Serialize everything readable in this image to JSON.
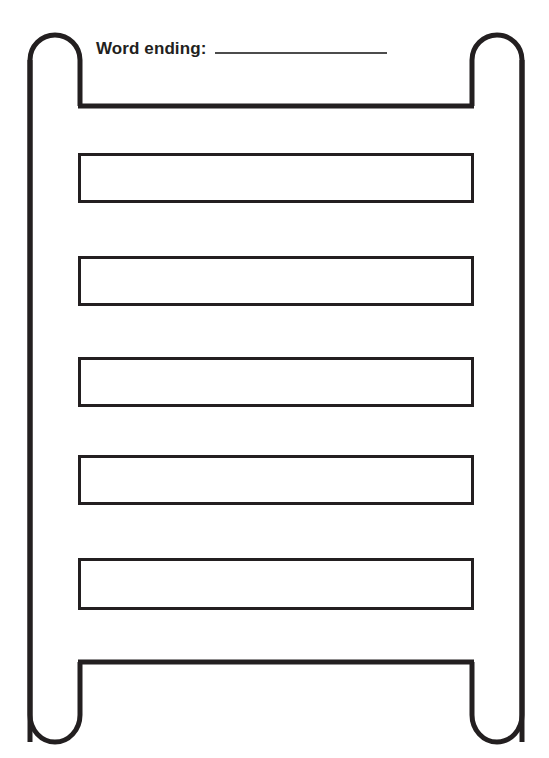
{
  "worksheet": {
    "title": "Word ladder worksheet",
    "prompt_label": "Word ending:",
    "prompt_value": "",
    "prompt_blank_placeholder": ""
  },
  "ladder": {
    "rail_color": "#231f20",
    "rung_border_color": "#231f20",
    "background_color": "#ffffff",
    "blank_line_color": "#4c4c4c",
    "rung_count": 5,
    "rungs": [
      {
        "index": 1,
        "value": ""
      },
      {
        "index": 2,
        "value": ""
      },
      {
        "index": 3,
        "value": ""
      },
      {
        "index": 4,
        "value": ""
      },
      {
        "index": 5,
        "value": ""
      }
    ]
  }
}
